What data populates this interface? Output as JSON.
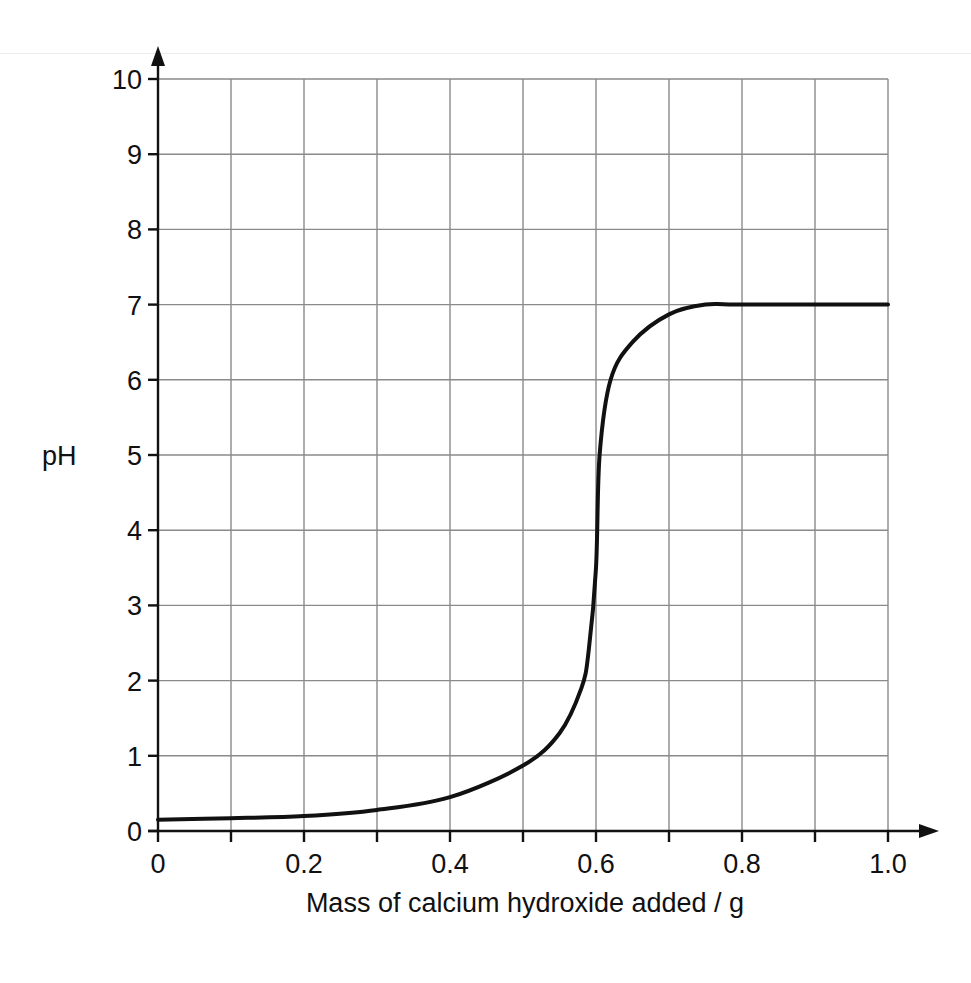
{
  "chart_data": {
    "type": "line",
    "title": "",
    "xlabel": "Mass of calcium hydroxide added / g",
    "ylabel": "pH",
    "xlim": [
      0,
      1.0
    ],
    "ylim": [
      0,
      10
    ],
    "grid": true,
    "x_ticks": [
      "0",
      "0.2",
      "0.4",
      "0.6",
      "0.8",
      "1.0"
    ],
    "x_minor_grid_step": 0.1,
    "y_ticks": [
      "0",
      "1",
      "2",
      "3",
      "4",
      "5",
      "6",
      "7",
      "8",
      "9",
      "10"
    ],
    "legend": null,
    "series": [
      {
        "name": "pH",
        "x": [
          0.0,
          0.1,
          0.2,
          0.3,
          0.4,
          0.5,
          0.55,
          0.58,
          0.59,
          0.6,
          0.605,
          0.62,
          0.65,
          0.7,
          0.75,
          0.8,
          1.0
        ],
        "y": [
          0.15,
          0.17,
          0.2,
          0.28,
          0.45,
          0.87,
          1.3,
          1.9,
          2.4,
          3.5,
          5.0,
          6.0,
          6.5,
          6.87,
          7.0,
          7.0,
          7.0
        ]
      }
    ],
    "colors": {
      "curve": "#111111",
      "grid": "#8a8a8a",
      "axis": "#111111"
    }
  }
}
